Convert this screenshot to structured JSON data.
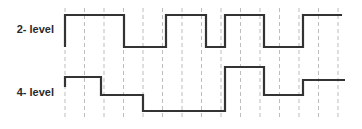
{
  "diagram": {
    "labels": [
      {
        "text": "2- level",
        "y": 23
      },
      {
        "text": "4- level",
        "y": 86
      }
    ],
    "colors": {
      "signal": "#333333",
      "grid": "#bdbdbd",
      "background": "#ffffff"
    },
    "grid": {
      "x": [
        65,
        84.5,
        104,
        123.5,
        143,
        162.5,
        182,
        201.5,
        221,
        240.5,
        260,
        279.5,
        299,
        318.5,
        338
      ],
      "y_top": 8,
      "y_bottom": 118
    },
    "signals": [
      {
        "name": "2-level",
        "start_y": 47,
        "points": [
          [
            65,
            15
          ],
          [
            124,
            15
          ],
          [
            124,
            47
          ],
          [
            166,
            47
          ],
          [
            166,
            15
          ],
          [
            206,
            15
          ],
          [
            206,
            47
          ],
          [
            225,
            47
          ],
          [
            225,
            15
          ],
          [
            264,
            15
          ],
          [
            264,
            47
          ],
          [
            303,
            47
          ],
          [
            303,
            15
          ],
          [
            342,
            15
          ]
        ]
      },
      {
        "name": "4-level",
        "start_y": 87,
        "points": [
          [
            65,
            77
          ],
          [
            101,
            77
          ],
          [
            101,
            95
          ],
          [
            143,
            95
          ],
          [
            143,
            111
          ],
          [
            225,
            111
          ],
          [
            225,
            67
          ],
          [
            264,
            67
          ],
          [
            264,
            95
          ],
          [
            303,
            95
          ],
          [
            303,
            80
          ],
          [
            345,
            80
          ]
        ]
      }
    ]
  }
}
